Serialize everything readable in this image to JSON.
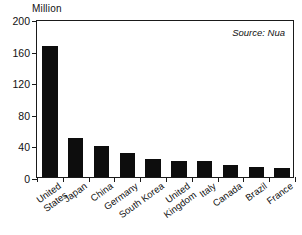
{
  "chart_data": {
    "type": "bar",
    "title": "",
    "subtitle": "",
    "xlabel": "",
    "ylabel": "Million",
    "ylim": [
      0,
      200
    ],
    "yticks": [
      0,
      40,
      80,
      120,
      160,
      200
    ],
    "grid": false,
    "legend": null,
    "orientation": "vertical",
    "bar_color": "#0d0d0d",
    "annotations": [
      {
        "name": "source",
        "text": "Source: Nua",
        "position": "top-right",
        "style": "italic"
      }
    ],
    "categories": [
      "United\nStates",
      "Japan",
      "China",
      "Germany",
      "South Korea",
      "United\nKingdom",
      "Italy",
      "Canada",
      "Brazil",
      "France"
    ],
    "values": [
      166,
      49,
      39,
      30,
      23,
      20,
      20,
      15,
      13,
      12
    ]
  },
  "axis": {
    "unit_label": "Million",
    "tick_labels": [
      "200",
      "160",
      "120",
      "80",
      "40",
      "0"
    ]
  },
  "source_note": "Source: Nua"
}
